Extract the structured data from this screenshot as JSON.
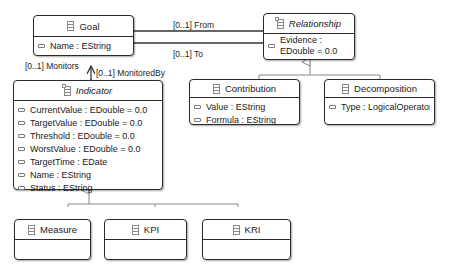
{
  "classes": {
    "goal": {
      "name": "Goal",
      "abstract": false,
      "attributes": [
        "Name : EString"
      ]
    },
    "relationship": {
      "name": "Relationship",
      "abstract": true,
      "attributes": [
        "Evidence :",
        "EDouble = 0.0"
      ]
    },
    "indicator": {
      "name": "Indicator",
      "abstract": true,
      "attributes": [
        "CurrentValue : EDouble = 0.0",
        "TargetValue : EDouble = 0.0",
        "Threshold : EDouble = 0.0",
        "WorstValue : EDouble = 0.0",
        "TargetTime : EDate",
        "Name : EString",
        "Status : EString"
      ]
    },
    "contribution": {
      "name": "Contribution",
      "abstract": false,
      "attributes": [
        "Value : EString",
        "Formula : EString"
      ]
    },
    "decomposition": {
      "name": "Decomposition",
      "abstract": false,
      "attributes": [
        "Type : LogicalOperator"
      ]
    },
    "measure": {
      "name": "Measure",
      "abstract": false,
      "attributes": []
    },
    "kpi": {
      "name": "KPI",
      "abstract": false,
      "attributes": []
    },
    "kri": {
      "name": "KRI",
      "abstract": false,
      "attributes": []
    }
  },
  "associations": {
    "from_label": "[0..1] From",
    "to_label": "[0..1] To",
    "monitors_label": "[0..1] Monitors",
    "monitored_by_label": "[0..1] MonitoredBy"
  },
  "colors": {
    "border": "#2b2b2b",
    "line": "#333333",
    "inheritance_line": "#888888",
    "background": "#ffffff"
  }
}
